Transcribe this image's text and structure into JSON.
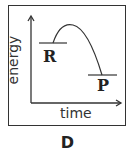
{
  "diagram": {
    "type": "energy-profile",
    "y_axis_label": "energy",
    "x_axis_label": "time",
    "reactant_label": "R",
    "product_label": "P",
    "caption": "D"
  }
}
